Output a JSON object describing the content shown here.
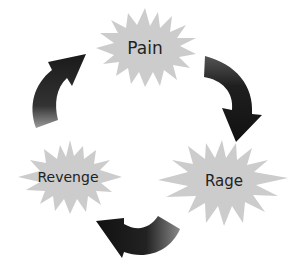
{
  "diagram": {
    "type": "cycle",
    "nodes": [
      {
        "id": "pain",
        "label": "Pain"
      },
      {
        "id": "rage",
        "label": "Rage"
      },
      {
        "id": "revenge",
        "label": "Revenge"
      }
    ],
    "edges": [
      {
        "from": "pain",
        "to": "rage"
      },
      {
        "from": "rage",
        "to": "revenge"
      },
      {
        "from": "revenge",
        "to": "pain"
      }
    ],
    "colors": {
      "starburst": "#cccccc",
      "arrow_dark": "#1a1a1a",
      "arrow_light": "#8a8a8a",
      "text": "#222222"
    }
  }
}
